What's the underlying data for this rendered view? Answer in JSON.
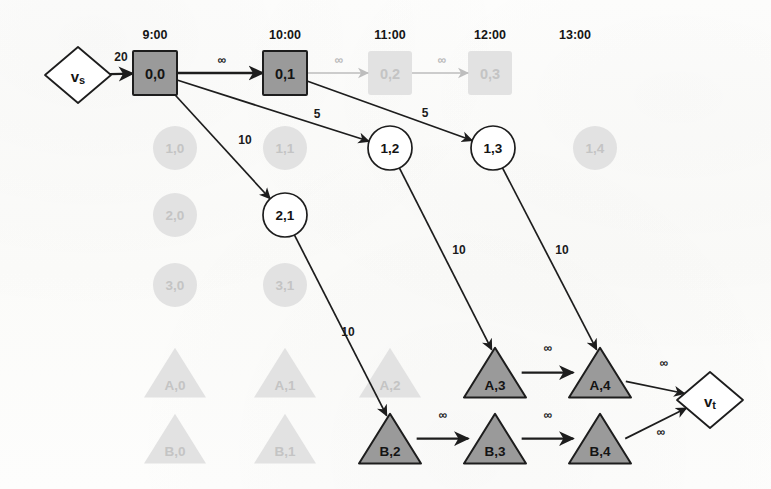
{
  "diagram": {
    "colors": {
      "active_fill": "#9a9a9a",
      "active_stroke": "#1d1d1d",
      "ghost_fill": "#e2e2e2",
      "ghost_text": "#c4c4c4",
      "edge": "#1d1d1d",
      "faded_edge": "#bdbdbd",
      "text": "#151515",
      "page": "#fdfdfc"
    },
    "time_axis": {
      "labels": [
        "9:00",
        "10:00",
        "11:00",
        "12:00",
        "13:00"
      ],
      "x": [
        155,
        285,
        390,
        490,
        575
      ],
      "y": 35
    },
    "terminals": [
      {
        "id": "vs",
        "label": "vs",
        "shape": "diamond",
        "x": 78,
        "y": 75,
        "rx": 33,
        "ry": 28,
        "state": "active"
      },
      {
        "id": "vt",
        "label": "vt",
        "shape": "diamond",
        "x": 710,
        "y": 400,
        "rx": 33,
        "ry": 28,
        "state": "active"
      }
    ],
    "nodes": [
      {
        "id": "0,0",
        "label": "0,0",
        "shape": "square",
        "x": 155,
        "y": 73,
        "size": 44,
        "state": "active"
      },
      {
        "id": "0,1",
        "label": "0,1",
        "shape": "square",
        "x": 285,
        "y": 73,
        "size": 44,
        "state": "active"
      },
      {
        "id": "0,2",
        "label": "0,2",
        "shape": "square",
        "x": 390,
        "y": 73,
        "size": 44,
        "state": "ghost"
      },
      {
        "id": "0,3",
        "label": "0,3",
        "shape": "square",
        "x": 490,
        "y": 73,
        "size": 44,
        "state": "ghost"
      },
      {
        "id": "1,0",
        "label": "1,0",
        "shape": "circle",
        "x": 175,
        "y": 148,
        "size": 22,
        "state": "ghost"
      },
      {
        "id": "1,1",
        "label": "1,1",
        "shape": "circle",
        "x": 285,
        "y": 148,
        "size": 22,
        "state": "ghost"
      },
      {
        "id": "1,2",
        "label": "1,2",
        "shape": "circle",
        "x": 390,
        "y": 148,
        "size": 22,
        "state": "active-outline"
      },
      {
        "id": "1,3",
        "label": "1,3",
        "shape": "circle",
        "x": 493,
        "y": 148,
        "size": 22,
        "state": "active-outline"
      },
      {
        "id": "1,4",
        "label": "1,4",
        "shape": "circle",
        "x": 595,
        "y": 148,
        "size": 22,
        "state": "ghost"
      },
      {
        "id": "2,0",
        "label": "2,0",
        "shape": "circle",
        "x": 175,
        "y": 215,
        "size": 22,
        "state": "ghost"
      },
      {
        "id": "2,1",
        "label": "2,1",
        "shape": "circle",
        "x": 285,
        "y": 215,
        "size": 22,
        "state": "active-outline"
      },
      {
        "id": "3,0",
        "label": "3,0",
        "shape": "circle",
        "x": 175,
        "y": 285,
        "size": 22,
        "state": "ghost"
      },
      {
        "id": "3,1",
        "label": "3,1",
        "shape": "circle",
        "x": 285,
        "y": 285,
        "size": 22,
        "state": "ghost"
      },
      {
        "id": "A,0",
        "label": "A,0",
        "shape": "triangle",
        "x": 175,
        "y": 372,
        "size": 31,
        "state": "ghost"
      },
      {
        "id": "A,1",
        "label": "A,1",
        "shape": "triangle",
        "x": 285,
        "y": 372,
        "size": 31,
        "state": "ghost"
      },
      {
        "id": "A,2",
        "label": "A,2",
        "shape": "triangle",
        "x": 390,
        "y": 372,
        "size": 31,
        "state": "ghost"
      },
      {
        "id": "A,3",
        "label": "A,3",
        "shape": "triangle",
        "x": 495,
        "y": 372,
        "size": 31,
        "state": "active"
      },
      {
        "id": "A,4",
        "label": "A,4",
        "shape": "triangle",
        "x": 600,
        "y": 372,
        "size": 31,
        "state": "active"
      },
      {
        "id": "B,0",
        "label": "B,0",
        "shape": "triangle",
        "x": 175,
        "y": 438,
        "size": 31,
        "state": "ghost"
      },
      {
        "id": "B,1",
        "label": "B,1",
        "shape": "triangle",
        "x": 285,
        "y": 438,
        "size": 31,
        "state": "ghost"
      },
      {
        "id": "B,2",
        "label": "B,2",
        "shape": "triangle",
        "x": 390,
        "y": 438,
        "size": 31,
        "state": "active"
      },
      {
        "id": "B,3",
        "label": "B,3",
        "shape": "triangle",
        "x": 495,
        "y": 438,
        "size": 31,
        "state": "active"
      },
      {
        "id": "B,4",
        "label": "B,4",
        "shape": "triangle",
        "x": 600,
        "y": 438,
        "size": 31,
        "state": "active"
      }
    ],
    "edges": [
      {
        "id": "vs-00",
        "from": "vs",
        "to": "0,0",
        "label": "20",
        "label_x": 121,
        "label_y": 57,
        "state": "active"
      },
      {
        "id": "00-01",
        "from": "0,0",
        "to": "0,1",
        "label": "∞",
        "label_x": 222,
        "label_y": 60,
        "state": "active"
      },
      {
        "id": "01-02",
        "from": "0,1",
        "to": "0,2",
        "label": "∞",
        "label_x": 339,
        "label_y": 60,
        "state": "faded"
      },
      {
        "id": "02-03",
        "from": "0,2",
        "to": "0,3",
        "label": "∞",
        "label_x": 442,
        "label_y": 60,
        "state": "faded"
      },
      {
        "id": "00-12",
        "from": "0,0",
        "to": "1,2",
        "label": "5",
        "label_x": 317,
        "label_y": 114,
        "state": "active"
      },
      {
        "id": "00-21",
        "from": "0,0",
        "to": "2,1",
        "label": "10",
        "label_x": 245,
        "label_y": 140,
        "state": "active"
      },
      {
        "id": "01-13",
        "from": "0,1",
        "to": "1,3",
        "label": "5",
        "label_x": 425,
        "label_y": 113,
        "state": "active"
      },
      {
        "id": "12-A3",
        "from": "1,2",
        "to": "A,3",
        "label": "10",
        "label_x": 459,
        "label_y": 250,
        "state": "active"
      },
      {
        "id": "13-A4",
        "from": "1,3",
        "to": "A,4",
        "label": "10",
        "label_x": 562,
        "label_y": 250,
        "state": "active"
      },
      {
        "id": "21-B2",
        "from": "2,1",
        "to": "B,2",
        "label": "10",
        "label_x": 348,
        "label_y": 332,
        "state": "active"
      },
      {
        "id": "A3-A4",
        "from": "A,3",
        "to": "A,4",
        "label": "∞",
        "label_x": 548,
        "label_y": 348,
        "state": "active"
      },
      {
        "id": "B2-B3",
        "from": "B,2",
        "to": "B,3",
        "label": "∞",
        "label_x": 443,
        "label_y": 415,
        "state": "active"
      },
      {
        "id": "B3-B4",
        "from": "B,3",
        "to": "B,4",
        "label": "∞",
        "label_x": 548,
        "label_y": 415,
        "state": "active"
      },
      {
        "id": "A4-vt",
        "from": "A,4",
        "to": "vt",
        "label": "∞",
        "label_x": 664,
        "label_y": 363,
        "state": "active"
      },
      {
        "id": "B4-vt",
        "from": "B,4",
        "to": "vt",
        "label": "∞",
        "label_x": 661,
        "label_y": 432,
        "state": "active"
      }
    ]
  }
}
